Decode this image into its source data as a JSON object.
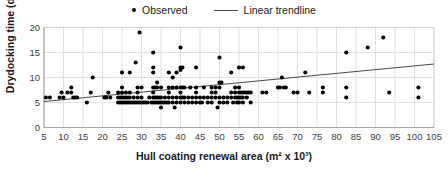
{
  "legend": {
    "position": "top-center",
    "entries": [
      {
        "label": "Observed",
        "marker": "dot-marker-icon",
        "color": "#000000"
      },
      {
        "label": "Linear trendline",
        "marker": "line-marker-icon",
        "color": "#4a4a4a"
      }
    ]
  },
  "axes": {
    "xlabel": "Hull coating renewal area (m² x 10³)",
    "ylabel": "Drydocking time (day)",
    "xticks": [
      5,
      10,
      15,
      20,
      25,
      30,
      35,
      40,
      45,
      50,
      55,
      60,
      65,
      70,
      75,
      80,
      85,
      90,
      95,
      100,
      105
    ],
    "yticks": [
      0,
      5,
      10,
      15,
      20
    ]
  },
  "chart_data": {
    "type": "scatter",
    "title": "",
    "subtitle": "",
    "xlabel": "Hull coating renewal area (m² x 10³)",
    "ylabel": "Drydocking time (day)",
    "xlim": [
      5,
      105
    ],
    "ylim": [
      0,
      20
    ],
    "xticks": [
      5,
      10,
      15,
      20,
      25,
      30,
      35,
      40,
      45,
      50,
      55,
      60,
      65,
      70,
      75,
      80,
      85,
      90,
      95,
      100,
      105
    ],
    "yticks": [
      0,
      5,
      10,
      15,
      20
    ],
    "grid": "vertical-major-and-horizontal-major",
    "legend_position": "top-center",
    "series": [
      {
        "name": "Observed",
        "type": "scatter",
        "marker": "filled-circle",
        "color": "#000000",
        "points": [
          [
            5.5,
            6
          ],
          [
            6.5,
            6
          ],
          [
            9,
            6
          ],
          [
            9.5,
            7
          ],
          [
            10,
            6
          ],
          [
            11,
            7
          ],
          [
            12,
            8
          ],
          [
            12,
            7
          ],
          [
            12.5,
            6
          ],
          [
            13,
            6
          ],
          [
            13.5,
            6
          ],
          [
            16,
            5
          ],
          [
            17,
            7
          ],
          [
            17.5,
            10
          ],
          [
            20.5,
            6
          ],
          [
            21,
            6
          ],
          [
            21.5,
            7
          ],
          [
            22,
            6
          ],
          [
            24,
            6
          ],
          [
            24,
            7
          ],
          [
            24,
            5
          ],
          [
            24.5,
            6
          ],
          [
            24.5,
            5
          ],
          [
            25,
            11
          ],
          [
            25,
            8
          ],
          [
            25,
            7
          ],
          [
            25,
            6
          ],
          [
            25,
            5
          ],
          [
            25.5,
            6
          ],
          [
            25.5,
            5
          ],
          [
            26,
            7
          ],
          [
            26,
            6
          ],
          [
            26,
            5
          ],
          [
            26.5,
            6
          ],
          [
            26.5,
            5
          ],
          [
            27,
            11
          ],
          [
            27,
            7
          ],
          [
            27,
            6
          ],
          [
            27,
            5
          ],
          [
            27.5,
            5
          ],
          [
            28,
            6
          ],
          [
            28,
            5
          ],
          [
            28.5,
            13
          ],
          [
            28.5,
            5
          ],
          [
            29,
            8
          ],
          [
            29,
            7
          ],
          [
            29,
            6
          ],
          [
            29,
            5
          ],
          [
            29.5,
            19
          ],
          [
            29.5,
            5
          ],
          [
            30,
            8
          ],
          [
            30,
            6
          ],
          [
            30,
            5
          ],
          [
            30.5,
            5
          ],
          [
            31,
            5
          ],
          [
            31.5,
            5
          ],
          [
            32,
            6
          ],
          [
            32.5,
            5
          ],
          [
            33,
            15
          ],
          [
            33,
            12
          ],
          [
            33,
            11
          ],
          [
            33,
            8
          ],
          [
            33,
            7
          ],
          [
            33,
            6
          ],
          [
            33,
            5
          ],
          [
            33.5,
            8
          ],
          [
            33.5,
            6
          ],
          [
            33.5,
            5
          ],
          [
            34,
            9
          ],
          [
            34,
            8
          ],
          [
            34,
            6
          ],
          [
            34,
            5
          ],
          [
            34.5,
            6
          ],
          [
            34.5,
            5
          ],
          [
            35,
            8
          ],
          [
            35,
            6
          ],
          [
            35,
            5
          ],
          [
            35,
            4
          ],
          [
            35.5,
            5
          ],
          [
            36,
            6
          ],
          [
            36,
            5
          ],
          [
            36.5,
            5
          ],
          [
            37,
            11
          ],
          [
            37,
            8
          ],
          [
            37,
            7
          ],
          [
            37,
            6
          ],
          [
            37,
            5
          ],
          [
            38,
            10
          ],
          [
            38,
            8
          ],
          [
            38,
            6
          ],
          [
            38,
            5
          ],
          [
            38.5,
            4
          ],
          [
            39,
            11
          ],
          [
            39,
            8
          ],
          [
            39,
            6
          ],
          [
            39,
            5
          ],
          [
            40,
            16
          ],
          [
            40,
            12
          ],
          [
            40,
            11.5
          ],
          [
            40,
            8
          ],
          [
            40,
            7
          ],
          [
            40,
            6
          ],
          [
            40,
            5
          ],
          [
            40.5,
            12
          ],
          [
            40.5,
            8
          ],
          [
            40.5,
            6
          ],
          [
            41,
            8
          ],
          [
            41,
            6
          ],
          [
            41,
            5
          ],
          [
            42,
            6
          ],
          [
            42,
            5
          ],
          [
            42.5,
            8
          ],
          [
            43,
            6
          ],
          [
            43,
            5
          ],
          [
            44,
            12
          ],
          [
            44,
            8
          ],
          [
            44,
            7
          ],
          [
            44,
            6
          ],
          [
            44,
            5
          ],
          [
            45,
            6
          ],
          [
            45,
            5
          ],
          [
            45.5,
            5
          ],
          [
            46,
            8
          ],
          [
            46,
            6
          ],
          [
            47,
            6
          ],
          [
            47,
            5
          ],
          [
            48,
            8
          ],
          [
            48,
            7
          ],
          [
            48,
            6
          ],
          [
            48,
            5
          ],
          [
            49,
            8
          ],
          [
            49,
            7
          ],
          [
            49,
            6
          ],
          [
            49.5,
            4
          ],
          [
            50,
            14
          ],
          [
            50,
            9
          ],
          [
            50,
            8
          ],
          [
            50,
            6
          ],
          [
            50,
            5
          ],
          [
            50.5,
            9
          ],
          [
            51,
            6
          ],
          [
            51,
            5
          ],
          [
            52,
            6
          ],
          [
            52,
            5
          ],
          [
            53,
            11
          ],
          [
            53,
            7
          ],
          [
            53,
            6
          ],
          [
            53.5,
            5
          ],
          [
            54,
            8
          ],
          [
            54,
            7
          ],
          [
            54,
            6
          ],
          [
            54.5,
            6
          ],
          [
            54.5,
            5
          ],
          [
            55,
            12
          ],
          [
            55,
            8
          ],
          [
            55,
            7
          ],
          [
            55,
            6
          ],
          [
            55,
            5
          ],
          [
            55.5,
            7
          ],
          [
            55.5,
            6
          ],
          [
            56,
            12
          ],
          [
            56,
            7
          ],
          [
            56,
            6
          ],
          [
            56,
            5
          ],
          [
            56.5,
            7
          ],
          [
            57,
            7
          ],
          [
            57,
            6
          ],
          [
            57.5,
            7
          ],
          [
            58,
            7
          ],
          [
            58,
            5
          ],
          [
            61,
            7
          ],
          [
            62,
            7
          ],
          [
            65,
            8
          ],
          [
            65.5,
            8
          ],
          [
            66,
            10
          ],
          [
            66.5,
            8
          ],
          [
            67,
            8
          ],
          [
            69,
            7
          ],
          [
            70,
            7
          ],
          [
            72,
            11
          ],
          [
            73,
            7
          ],
          [
            76.5,
            8
          ],
          [
            76.5,
            7
          ],
          [
            82.5,
            15
          ],
          [
            82.5,
            8
          ],
          [
            82.5,
            6
          ],
          [
            88,
            16
          ],
          [
            92,
            18
          ],
          [
            93.5,
            7
          ],
          [
            101,
            8
          ],
          [
            101,
            6
          ]
        ]
      },
      {
        "name": "Linear trendline",
        "type": "line",
        "color": "#4a4a4a",
        "points": [
          [
            5,
            5.2
          ],
          [
            105,
            12.7
          ]
        ]
      }
    ]
  }
}
